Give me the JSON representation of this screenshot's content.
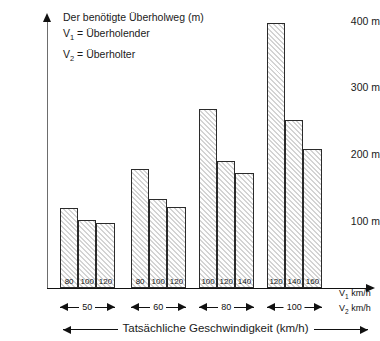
{
  "legend": {
    "title": "Der benötigte Überholweg (m)",
    "line2_prefix": "V",
    "line2_sub": "1",
    "line2_text": " = Überholender",
    "line3_prefix": "V",
    "line3_sub": "2",
    "line3_text": " = Überholter"
  },
  "axes": {
    "y_ticks": [
      "400 m",
      "300 m",
      "200 m",
      "100 m"
    ],
    "v1_caption_prefix": "V",
    "v1_caption_sub": "1",
    "v1_caption_unit": " km/h",
    "v2_caption_prefix": "V",
    "v2_caption_sub": "2",
    "v2_caption_unit": " km/h",
    "x_title": "Tatsächliche Geschwindigkeit (km/h)"
  },
  "chart_data": {
    "type": "bar",
    "title": "Der benötigte Überholweg (m)",
    "xlabel": "Tatsächliche Geschwindigkeit (km/h)",
    "ylabel": "Überholweg (m)",
    "ylim": [
      0,
      400
    ],
    "ytick_values": [
      100,
      200,
      300,
      400
    ],
    "ytick_labels": [
      "100 m",
      "200 m",
      "300 m",
      "400 m"
    ],
    "grid": false,
    "legend_position": "top-left",
    "group_axis_label": "V2 km/h",
    "bar_axis_label": "V1 km/h",
    "groups": [
      {
        "v2": "50",
        "bars": [
          {
            "v1": "80",
            "value": 120
          },
          {
            "v1": "100",
            "value": 102
          },
          {
            "v1": "120",
            "value": 98
          }
        ]
      },
      {
        "v2": "60",
        "bars": [
          {
            "v1": "80",
            "value": 178
          },
          {
            "v1": "100",
            "value": 133
          },
          {
            "v1": "120",
            "value": 122
          }
        ]
      },
      {
        "v2": "80",
        "bars": [
          {
            "v1": "100",
            "value": 268
          },
          {
            "v1": "120",
            "value": 190
          },
          {
            "v1": "140",
            "value": 172
          }
        ]
      },
      {
        "v2": "100",
        "bars": [
          {
            "v1": "120",
            "value": 397
          },
          {
            "v1": "140",
            "value": 251
          },
          {
            "v1": "160",
            "value": 208
          }
        ]
      }
    ]
  }
}
